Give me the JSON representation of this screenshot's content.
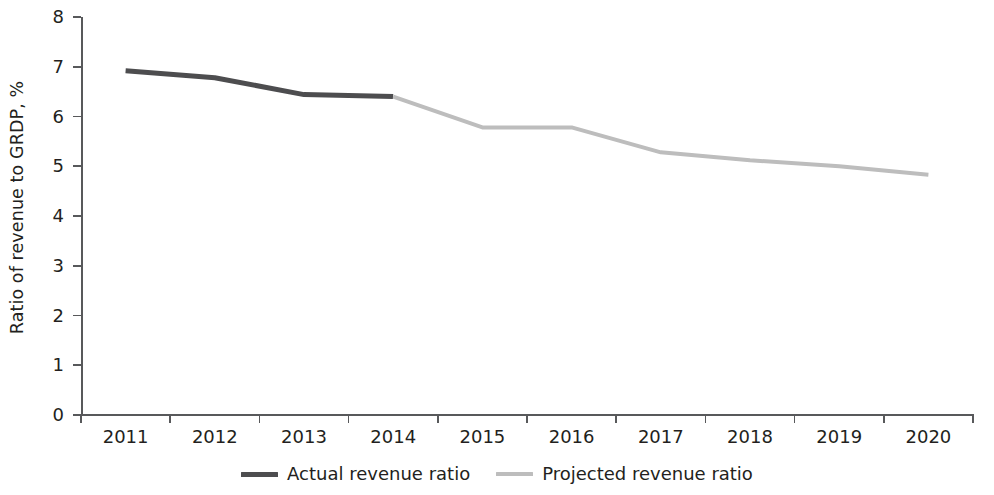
{
  "chart_data": {
    "type": "line",
    "title": "",
    "xlabel": "",
    "ylabel": "Ratio of revenue to GRDP, %",
    "x": [
      "2011",
      "2012",
      "2013",
      "2014",
      "2015",
      "2016",
      "2017",
      "2018",
      "2019",
      "2020"
    ],
    "xtick_labels": [
      "2011",
      "2012",
      "2013",
      "2014",
      "2015",
      "2016",
      "2017",
      "2018",
      "2019",
      "2020"
    ],
    "ytick_labels": [
      "8",
      "7",
      "6",
      "5",
      "4",
      "3",
      "2",
      "1",
      "0"
    ],
    "yticks": [
      8,
      7,
      6,
      5,
      4,
      3,
      2,
      1,
      0
    ],
    "ylim": [
      0,
      8
    ],
    "grid": false,
    "legend_position": "bottom-center",
    "series": [
      {
        "name": "Actual revenue ratio",
        "color": "#4d4d4f",
        "x": [
          "2011",
          "2012",
          "2013",
          "2014"
        ],
        "values": [
          6.92,
          6.78,
          6.44,
          6.4
        ]
      },
      {
        "name": "Projected revenue ratio",
        "color": "#bdbdbd",
        "x": [
          "2014",
          "2015",
          "2016",
          "2017",
          "2018",
          "2019",
          "2020"
        ],
        "values": [
          6.4,
          5.78,
          5.78,
          5.28,
          5.12,
          5.0,
          4.83
        ]
      }
    ]
  },
  "axes": {
    "y_title": "Ratio of revenue to GRDP, %",
    "y_labels": [
      "8",
      "7",
      "6",
      "5",
      "4",
      "3",
      "2",
      "1",
      "0"
    ],
    "x_labels": [
      "2011",
      "2012",
      "2013",
      "2014",
      "2015",
      "2016",
      "2017",
      "2018",
      "2019",
      "2020"
    ],
    "axis_color": "#58595b"
  },
  "legend": {
    "items": [
      {
        "label": "Actual revenue ratio",
        "color": "#4d4d4f"
      },
      {
        "label": "Projected revenue ratio",
        "color": "#bdbdbd"
      }
    ]
  }
}
